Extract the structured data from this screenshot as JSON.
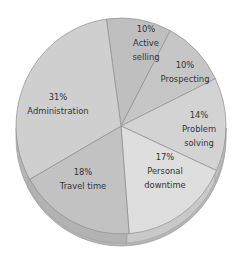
{
  "chart_data": {
    "type": "pie",
    "title": "",
    "style": "3d-tilted",
    "categories": [
      "Active selling",
      "Prospecting",
      "Problem solving",
      "Personal downtime",
      "Travel time",
      "Administration"
    ],
    "values": [
      10,
      10,
      14,
      17,
      18,
      31
    ],
    "unit": "%",
    "labels": [
      {
        "pct": "10%",
        "name_lines": [
          "Active",
          "selling"
        ]
      },
      {
        "pct": "10%",
        "name_lines": [
          "Prospecting"
        ]
      },
      {
        "pct": "14%",
        "name_lines": [
          "Problem",
          "solving"
        ]
      },
      {
        "pct": "17%",
        "name_lines": [
          "Personal",
          "downtime"
        ]
      },
      {
        "pct": "18%",
        "name_lines": [
          "Travel time"
        ]
      },
      {
        "pct": "31%",
        "name_lines": [
          "Administration"
        ]
      }
    ],
    "colors": [
      "#bfbfbf",
      "#c6c6c6",
      "#d3d3d3",
      "#dedede",
      "#c2c2c2",
      "#cfcfcf"
    ],
    "legend": "none",
    "grid": false
  }
}
